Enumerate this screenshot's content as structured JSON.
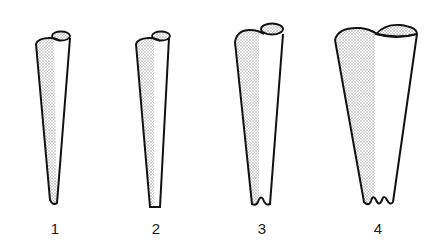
{
  "figure": {
    "shapes": [
      {
        "id": 1,
        "label": "1",
        "tip": "rounded"
      },
      {
        "id": 2,
        "label": "2",
        "tip": "flat"
      },
      {
        "id": 3,
        "label": "3",
        "tip": "single notch"
      },
      {
        "id": 4,
        "label": "4",
        "tip": "double notch"
      }
    ],
    "colors": {
      "stroke": "#111111",
      "shade": "#bdbdbd",
      "background": "#ffffff"
    }
  }
}
